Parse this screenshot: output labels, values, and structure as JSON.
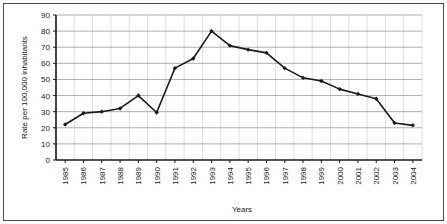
{
  "chart_data": {
    "type": "line",
    "title": "",
    "xlabel": "Years",
    "ylabel": "Rate per 100,000 inhabitants",
    "categories": [
      "1985",
      "1986",
      "1987",
      "1988",
      "1989",
      "1990",
      "1991",
      "1992",
      "1993",
      "1994",
      "1995",
      "1996",
      "1997",
      "1998",
      "1999",
      "2000",
      "2001",
      "2002",
      "2003",
      "2004"
    ],
    "values": [
      22,
      29,
      30,
      32,
      40,
      29.5,
      57,
      63,
      80,
      71,
      68.5,
      66.5,
      57,
      51,
      49,
      44,
      41,
      38,
      23,
      21.5
    ],
    "series": [
      {
        "name": "Rate per 100,000 inhabitants",
        "values": [
          22,
          29,
          30,
          32,
          40,
          29.5,
          57,
          63,
          80,
          71,
          68.5,
          66.5,
          57,
          51,
          49,
          44,
          41,
          38,
          23,
          21.5
        ]
      }
    ],
    "ylim": [
      0,
      90
    ],
    "yticks": [
      0,
      10,
      20,
      30,
      40,
      50,
      60,
      70,
      80,
      90
    ],
    "ytick_labels": [
      "0",
      "10",
      "20",
      "30",
      "40",
      "50",
      "60",
      "70",
      "80",
      "90"
    ],
    "grid": "horizontal-and-vertical",
    "legend": "none",
    "line_color": "#1a1a1a",
    "marker": "diamond",
    "gridline_color": "#9a9a9a",
    "axis_color": "#1a1a1a",
    "background_color": "#ffffff",
    "xtick_rotation": "90"
  }
}
